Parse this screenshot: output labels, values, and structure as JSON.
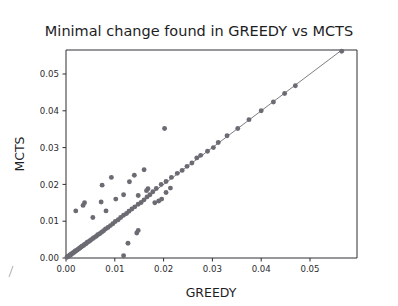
{
  "chart_data": {
    "type": "scatter",
    "title": "Minimal change found in GREEDY vs MCTS",
    "xlabel": "GREEDY",
    "ylabel": "MCTS",
    "xlim": [
      -0.0015,
      0.0595
    ],
    "ylim": [
      -0.0016,
      0.0585
    ],
    "xticks": [
      0.0,
      0.01,
      0.02,
      0.03,
      0.04,
      0.05
    ],
    "xticklabels": [
      "0.00",
      "0.01",
      "0.02",
      "0.03",
      "0.04",
      "0.05"
    ],
    "yticks": [
      0.0,
      0.01,
      0.02,
      0.03,
      0.04,
      0.05
    ],
    "yticklabels": [
      "0.00",
      "0.01",
      "0.02",
      "0.03",
      "0.04",
      "0.05"
    ],
    "grid": false,
    "legend": null,
    "marker_color": "#6b6b73",
    "marker_size": 4.4,
    "reference_line": {
      "description": "identity / fitted diagonal line",
      "x": [
        0.0,
        0.0565
      ],
      "y": [
        0.0,
        0.0565
      ],
      "color": "#6e6e76"
    },
    "series": [
      {
        "name": "instances",
        "points": [
          [
            0.0002,
            0.0002
          ],
          [
            0.0004,
            0.0004
          ],
          [
            0.0005,
            0.0005
          ],
          [
            0.0007,
            0.0006
          ],
          [
            0.0008,
            0.0008
          ],
          [
            0.001,
            0.0009
          ],
          [
            0.0011,
            0.0011
          ],
          [
            0.0013,
            0.0012
          ],
          [
            0.0014,
            0.0014
          ],
          [
            0.0016,
            0.0015
          ],
          [
            0.0018,
            0.0017
          ],
          [
            0.0019,
            0.0019
          ],
          [
            0.0021,
            0.002
          ],
          [
            0.0023,
            0.0022
          ],
          [
            0.0025,
            0.0024
          ],
          [
            0.0027,
            0.0026
          ],
          [
            0.0029,
            0.0028
          ],
          [
            0.0031,
            0.003
          ],
          [
            0.0033,
            0.0032
          ],
          [
            0.0036,
            0.0034
          ],
          [
            0.0038,
            0.0037
          ],
          [
            0.0041,
            0.0039
          ],
          [
            0.0043,
            0.0042
          ],
          [
            0.0046,
            0.0044
          ],
          [
            0.0049,
            0.0047
          ],
          [
            0.0052,
            0.005
          ],
          [
            0.0055,
            0.0053
          ],
          [
            0.0058,
            0.0056
          ],
          [
            0.0062,
            0.0059
          ],
          [
            0.0065,
            0.0063
          ],
          [
            0.0069,
            0.0066
          ],
          [
            0.0073,
            0.007
          ],
          [
            0.0077,
            0.0074
          ],
          [
            0.0081,
            0.0079
          ],
          [
            0.0086,
            0.0083
          ],
          [
            0.0091,
            0.0088
          ],
          [
            0.0096,
            0.0093
          ],
          [
            0.0101,
            0.0099
          ],
          [
            0.0107,
            0.0104
          ],
          [
            0.0112,
            0.011
          ],
          [
            0.0118,
            0.0116
          ],
          [
            0.0124,
            0.0121
          ],
          [
            0.0129,
            0.0127
          ],
          [
            0.0135,
            0.0133
          ],
          [
            0.0141,
            0.0139
          ],
          [
            0.0148,
            0.0146
          ],
          [
            0.0154,
            0.0151
          ],
          [
            0.016,
            0.0158
          ],
          [
            0.0166,
            0.0166
          ],
          [
            0.0172,
            0.0172
          ],
          [
            0.0165,
            0.0183
          ],
          [
            0.0168,
            0.0188
          ],
          [
            0.0178,
            0.018
          ],
          [
            0.0185,
            0.0189
          ],
          [
            0.0195,
            0.02
          ],
          [
            0.0205,
            0.0208
          ],
          [
            0.0216,
            0.0219
          ],
          [
            0.0228,
            0.023
          ],
          [
            0.0238,
            0.0238
          ],
          [
            0.0248,
            0.0249
          ],
          [
            0.0258,
            0.0258
          ],
          [
            0.0268,
            0.0272
          ],
          [
            0.0276,
            0.0279
          ],
          [
            0.029,
            0.029
          ],
          [
            0.0302,
            0.03
          ],
          [
            0.0312,
            0.0314
          ],
          [
            0.033,
            0.0332
          ],
          [
            0.0352,
            0.0352
          ],
          [
            0.0375,
            0.0376
          ],
          [
            0.04,
            0.04
          ],
          [
            0.0425,
            0.0424
          ],
          [
            0.0448,
            0.0447
          ],
          [
            0.047,
            0.0468
          ],
          [
            0.0565,
            0.0562
          ],
          [
            0.002,
            0.0128
          ],
          [
            0.0035,
            0.0143
          ],
          [
            0.0038,
            0.015
          ],
          [
            0.0055,
            0.011
          ],
          [
            0.0072,
            0.0152
          ],
          [
            0.0074,
            0.0198
          ],
          [
            0.0082,
            0.0128
          ],
          [
            0.0093,
            0.0219
          ],
          [
            0.0102,
            0.016
          ],
          [
            0.0118,
            0.0172
          ],
          [
            0.013,
            0.0207
          ],
          [
            0.014,
            0.0225
          ],
          [
            0.0148,
            0.017
          ],
          [
            0.016,
            0.024
          ],
          [
            0.0202,
            0.0352
          ],
          [
            0.0127,
            0.004
          ],
          [
            0.0145,
            0.0068
          ],
          [
            0.0148,
            0.0075
          ],
          [
            0.0182,
            0.015
          ],
          [
            0.019,
            0.0155
          ],
          [
            0.0196,
            0.016
          ],
          [
            0.0118,
            0.0006
          ],
          [
            0.0205,
            0.0178
          ],
          [
            0.0214,
            0.019
          ]
        ]
      }
    ]
  },
  "axes_geometry": {
    "plot_left_px": 66,
    "plot_right_px": 357,
    "plot_top_px": 50,
    "plot_bottom_px": 258,
    "x_origin_value": 0.0,
    "x_px_per_unit": 4880,
    "y_origin_px": 258,
    "y_px_per_unit": 3680
  },
  "artifact": {
    "name": "scan-mark",
    "visible": true
  }
}
